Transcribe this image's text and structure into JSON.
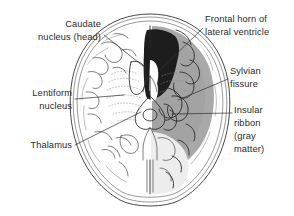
{
  "figure": {
    "kind": "axial-brain-ct-diagram",
    "background_color": "#ffffff",
    "ink_color": "#2a2a2a"
  },
  "regions": {
    "skull_outer_color": "#ffffff",
    "skull_line_color": "#4a4a4a",
    "affected_hemisphere_shade": "#a9a9a9",
    "ventricle_dark_shade": "#1d1d1d",
    "posterior_light_shade": "#ededed",
    "normal_hemisphere_shade": "#ffffff",
    "stipple_color": "#8f8f8f"
  },
  "labels": [
    {
      "id": "caudate-nucleus",
      "lines": [
        "Caudate",
        "nucleus (head)"
      ],
      "align": "end",
      "x": 101,
      "y": 27
    },
    {
      "id": "frontal-horn",
      "lines": [
        "Frontal horn of",
        "lateral ventricle"
      ],
      "align": "start",
      "x": 205,
      "y": 22
    },
    {
      "id": "sylvian-fissure",
      "lines": [
        "Sylvian",
        "fissure"
      ],
      "align": "start",
      "x": 230,
      "y": 74
    },
    {
      "id": "insular-ribbon",
      "lines": [
        "Insular",
        "ribbon",
        "(gray",
        "matter)"
      ],
      "align": "start",
      "x": 234,
      "y": 113
    },
    {
      "id": "lentiform-nucleus",
      "lines": [
        "Lentiform",
        "nucleus"
      ],
      "align": "end",
      "x": 72,
      "y": 96
    },
    {
      "id": "thalamus",
      "lines": [
        "Thalamus"
      ],
      "align": "end",
      "x": 72,
      "y": 148
    }
  ]
}
